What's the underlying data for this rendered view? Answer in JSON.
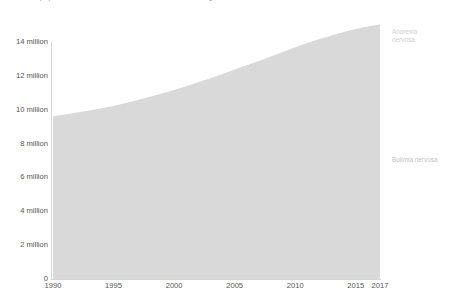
{
  "header": {
    "subtitle": "Total number of people with anorexia and bulimia nervosa. This is measured across all ages and both sexes.",
    "corner_mark": "?"
  },
  "axes": {
    "y_ticks": [
      "0",
      "2 million",
      "4 million",
      "6 million",
      "8 million",
      "10 million",
      "12 million",
      "14 million"
    ],
    "x_ticks": [
      "1990",
      "1995",
      "2000",
      "2005",
      "2010",
      "2015",
      "2017"
    ]
  },
  "legend": {
    "anorexia_label_line1": "Anorexia",
    "anorexia_label_line2": "nervosa",
    "bulimia_label": "Bulimia nervosa"
  },
  "colors": {
    "anorexia": "#d9d9d9",
    "bulimia": "#b8b8b8",
    "axis": "#d6d6d6",
    "text": "#555555",
    "label_light": "#cfcfcf"
  },
  "chart_data": {
    "type": "area",
    "title": "",
    "subtitle": "Total number of people with anorexia and bulimia nervosa. This is measured across all ages and both sexes.",
    "xlabel": "",
    "ylabel": "",
    "stacked": true,
    "grid": false,
    "legend_position": "right",
    "xlim": [
      1990,
      2017
    ],
    "ylim": [
      0,
      15
    ],
    "y_tick_values": [
      0,
      2,
      4,
      6,
      8,
      10,
      12,
      14
    ],
    "y_tick_labels": [
      "0",
      "2 million",
      "4 million",
      "6 million",
      "8 million",
      "10 million",
      "12 million",
      "14 million"
    ],
    "x_tick_values": [
      1990,
      1995,
      2000,
      2005,
      2010,
      2015,
      2017
    ],
    "x_tick_labels": [
      "1990",
      "1995",
      "2000",
      "2005",
      "2010",
      "2015",
      "2017"
    ],
    "unit": "people",
    "x": [
      1990,
      1991,
      1992,
      1993,
      1994,
      1995,
      1996,
      1997,
      1998,
      1999,
      2000,
      2001,
      2002,
      2003,
      2004,
      2005,
      2006,
      2007,
      2008,
      2009,
      2010,
      2011,
      2012,
      2013,
      2014,
      2015,
      2016,
      2017
    ],
    "series": [
      {
        "name": "Bulimia nervosa",
        "color": "#b8b8b8",
        "values": [
          7.5,
          7.58,
          7.67,
          7.77,
          7.88,
          8.0,
          8.14,
          8.29,
          8.45,
          8.62,
          8.8,
          8.99,
          9.19,
          9.4,
          9.62,
          9.85,
          10.08,
          10.32,
          10.57,
          10.82,
          11.07,
          11.3,
          11.52,
          11.72,
          11.91,
          12.08,
          12.22,
          12.33
        ]
      },
      {
        "name": "Anorexia nervosa",
        "color": "#d9d9d9",
        "values": [
          2.12,
          2.14,
          2.16,
          2.18,
          2.2,
          2.22,
          2.25,
          2.28,
          2.31,
          2.34,
          2.37,
          2.4,
          2.43,
          2.46,
          2.49,
          2.52,
          2.54,
          2.56,
          2.58,
          2.6,
          2.62,
          2.64,
          2.66,
          2.67,
          2.68,
          2.69,
          2.7,
          2.71
        ]
      }
    ],
    "totals": [
      9.62,
      9.72,
      9.83,
      9.95,
      10.08,
      10.22,
      10.39,
      10.57,
      10.76,
      10.96,
      11.17,
      11.39,
      11.62,
      11.86,
      12.11,
      12.37,
      12.62,
      12.88,
      13.15,
      13.42,
      13.69,
      13.94,
      14.18,
      14.39,
      14.59,
      14.77,
      14.92,
      15.04
    ]
  }
}
